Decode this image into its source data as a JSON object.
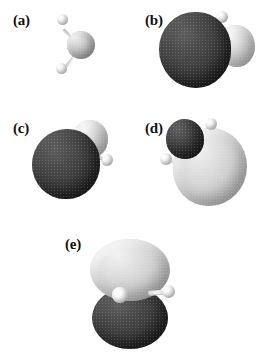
{
  "figure": {
    "background_color": "#ffffff",
    "panel_count": 5
  },
  "colors": {
    "dark_lobe": "#3b3b3b",
    "light_lobe": "#cfcfcf",
    "hydrogen_atom": "#f2f2f2",
    "oxygen_atom": "#bdbdbd",
    "label_text": "#111111",
    "background": "#ffffff"
  },
  "panels": [
    {
      "id": "a",
      "label": "(a)",
      "content_name": "water-molecule-ball-and-stick",
      "atoms": [
        {
          "element": "O",
          "name": "oxygen-atom"
        },
        {
          "element": "H",
          "name": "hydrogen-atom-upper"
        },
        {
          "element": "H",
          "name": "hydrogen-atom-lower"
        }
      ],
      "lobes": []
    },
    {
      "id": "b",
      "label": "(b)",
      "content_name": "molecular-orbital-b",
      "atoms": [
        {
          "element": "H",
          "name": "hydrogen-atom-upper"
        },
        {
          "element": "H",
          "name": "hydrogen-atom-lower"
        }
      ],
      "lobes": [
        {
          "phase": "dark",
          "name": "orbital-lobe-dark-large"
        },
        {
          "phase": "light",
          "name": "orbital-lobe-light-small"
        }
      ]
    },
    {
      "id": "c",
      "label": "(c)",
      "content_name": "molecular-orbital-c",
      "atoms": [
        {
          "element": "H",
          "name": "hydrogen-atom-right"
        }
      ],
      "lobes": [
        {
          "phase": "dark",
          "name": "orbital-lobe-dark-large"
        },
        {
          "phase": "light",
          "name": "orbital-lobe-light-small"
        }
      ]
    },
    {
      "id": "d",
      "label": "(d)",
      "content_name": "molecular-orbital-d",
      "atoms": [
        {
          "element": "H",
          "name": "hydrogen-atom-upper"
        },
        {
          "element": "H",
          "name": "hydrogen-atom-lower"
        }
      ],
      "lobes": [
        {
          "phase": "light",
          "name": "orbital-lobe-light-large"
        },
        {
          "phase": "dark",
          "name": "orbital-lobe-dark-small"
        }
      ]
    },
    {
      "id": "e",
      "label": "(e)",
      "content_name": "molecular-orbital-e",
      "atoms": [
        {
          "element": "H",
          "name": "hydrogen-atom-front"
        },
        {
          "element": "H",
          "name": "hydrogen-atom-right"
        }
      ],
      "lobes": [
        {
          "phase": "light",
          "name": "orbital-lobe-light-top"
        },
        {
          "phase": "dark",
          "name": "orbital-lobe-dark-bottom"
        }
      ]
    }
  ]
}
